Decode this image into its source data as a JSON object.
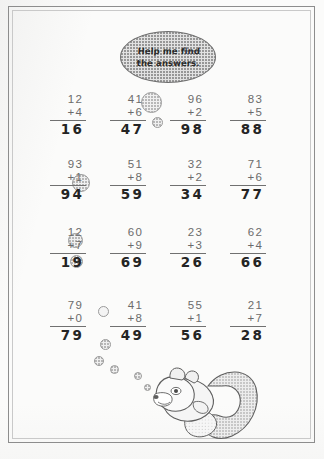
{
  "worksheet": {
    "title": "Addition Practice Worksheet",
    "speech_bubble": {
      "line1": "Help me find",
      "line2": "the answers.",
      "text": "Help me find\nthe answers.",
      "fill_color": "#e2e2e2",
      "border_color": "#6f6f6f"
    },
    "frame": {
      "outer_color": "#8d8d8d",
      "inner_color": "#c9c9c9"
    },
    "paper_color": "#fbfbfa",
    "printed_text_color": "#6b6b6b",
    "handwritten_answer_color": "#242424",
    "columns": 4,
    "rows": 4,
    "problems": [
      {
        "id": "r1c1",
        "top": "12",
        "operator": "+",
        "bottom": "+4",
        "addend2": "4",
        "answer": "16",
        "row": 1,
        "col": 1,
        "x": 40,
        "y": 93
      },
      {
        "id": "r1c2",
        "top": "41",
        "operator": "+",
        "bottom": "+6",
        "addend2": "6",
        "answer": "47",
        "row": 1,
        "col": 2,
        "x": 100,
        "y": 93
      },
      {
        "id": "r1c3",
        "top": "96",
        "operator": "+",
        "bottom": "+2",
        "addend2": "2",
        "answer": "98",
        "row": 1,
        "col": 3,
        "x": 160,
        "y": 93
      },
      {
        "id": "r1c4",
        "top": "83",
        "operator": "+",
        "bottom": "+5",
        "addend2": "5",
        "answer": "88",
        "row": 1,
        "col": 4,
        "x": 220,
        "y": 93
      },
      {
        "id": "r2c1",
        "top": "93",
        "operator": "+",
        "bottom": "+1",
        "addend2": "1",
        "answer": "94",
        "row": 2,
        "col": 1,
        "x": 40,
        "y": 158
      },
      {
        "id": "r2c2",
        "top": "51",
        "operator": "+",
        "bottom": "+8",
        "addend2": "8",
        "answer": "59",
        "row": 2,
        "col": 2,
        "x": 100,
        "y": 158
      },
      {
        "id": "r2c3",
        "top": "32",
        "operator": "+",
        "bottom": "+2",
        "addend2": "2",
        "answer": "34",
        "row": 2,
        "col": 3,
        "x": 160,
        "y": 158
      },
      {
        "id": "r2c4",
        "top": "71",
        "operator": "+",
        "bottom": "+6",
        "addend2": "6",
        "answer": "77",
        "row": 2,
        "col": 4,
        "x": 220,
        "y": 158
      },
      {
        "id": "r3c1",
        "top": "12",
        "operator": "+",
        "bottom": "+7",
        "addend2": "7",
        "answer": "19",
        "row": 3,
        "col": 1,
        "x": 40,
        "y": 226
      },
      {
        "id": "r3c2",
        "top": "60",
        "operator": "+",
        "bottom": "+9",
        "addend2": "9",
        "answer": "69",
        "row": 3,
        "col": 2,
        "x": 100,
        "y": 226
      },
      {
        "id": "r3c3",
        "top": "23",
        "operator": "+",
        "bottom": "+3",
        "addend2": "3",
        "answer": "26",
        "row": 3,
        "col": 3,
        "x": 160,
        "y": 226
      },
      {
        "id": "r3c4",
        "top": "62",
        "operator": "+",
        "bottom": "+4",
        "addend2": "4",
        "answer": "66",
        "row": 3,
        "col": 4,
        "x": 220,
        "y": 226
      },
      {
        "id": "r4c1",
        "top": "79",
        "operator": "+",
        "bottom": "+0",
        "addend2": "0",
        "answer": "79",
        "row": 4,
        "col": 1,
        "x": 40,
        "y": 299
      },
      {
        "id": "r4c2",
        "top": "41",
        "operator": "+",
        "bottom": "+8",
        "addend2": "8",
        "answer": "49",
        "row": 4,
        "col": 2,
        "x": 100,
        "y": 299
      },
      {
        "id": "r4c3",
        "top": "55",
        "operator": "+",
        "bottom": "+1",
        "addend2": "1",
        "answer": "56",
        "row": 4,
        "col": 3,
        "x": 160,
        "y": 299
      },
      {
        "id": "r4c4",
        "top": "21",
        "operator": "+",
        "bottom": "+7",
        "addend2": "7",
        "answer": "28",
        "row": 4,
        "col": 4,
        "x": 220,
        "y": 299
      }
    ],
    "bubbles": [
      {
        "x": 141,
        "y": 92,
        "size": 21,
        "style": "stipple"
      },
      {
        "x": 152,
        "y": 117,
        "size": 11,
        "style": "stipple"
      },
      {
        "x": 72,
        "y": 174,
        "size": 18,
        "style": "stipple"
      },
      {
        "x": 68,
        "y": 233,
        "size": 15,
        "style": "stipple"
      },
      {
        "x": 70,
        "y": 255,
        "size": 13,
        "style": "stipple"
      },
      {
        "x": 98,
        "y": 306,
        "size": 11,
        "style": "plain"
      },
      {
        "x": 100,
        "y": 339,
        "size": 11,
        "style": "stipple"
      },
      {
        "x": 94,
        "y": 356,
        "size": 10,
        "style": "stipple"
      },
      {
        "x": 110,
        "y": 365,
        "size": 9,
        "style": "stipple"
      },
      {
        "x": 134,
        "y": 372,
        "size": 8,
        "style": "stipple"
      },
      {
        "x": 144,
        "y": 384,
        "size": 7,
        "style": "stipple"
      }
    ],
    "illustration": {
      "name": "squirrel",
      "description": "Cartoon squirrel with large stippled bushy tail",
      "body_color": "#f1f1f1",
      "tail_color": "#d8d8d8",
      "outline_color": "#5e5e5e"
    }
  }
}
